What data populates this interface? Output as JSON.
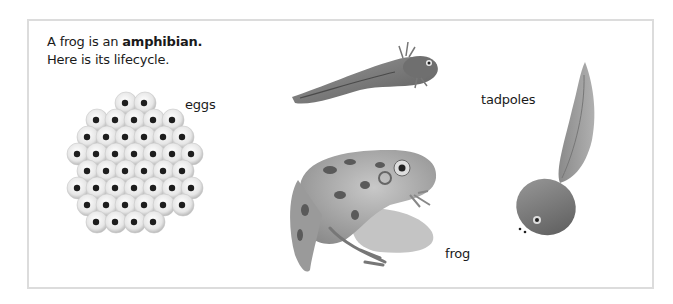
{
  "intro": {
    "line1_prefix": "A frog is an ",
    "line1_bold": "amphibian.",
    "line2": "Here is its lifecycle."
  },
  "labels": {
    "eggs": "eggs",
    "tadpoles": "tadpoles",
    "frog": "frog"
  },
  "illustrations": [
    {
      "name": "frog-spawn-eggs",
      "stage": "eggs"
    },
    {
      "name": "tadpole-with-external-gills",
      "stage": "tadpoles"
    },
    {
      "name": "young-tadpole",
      "stage": "tadpoles"
    },
    {
      "name": "adult-frog",
      "stage": "frog"
    }
  ],
  "colors": {
    "frame_border": "#dcdcdc",
    "text": "#1a1a1a",
    "illustration_tone": "grayscale"
  }
}
